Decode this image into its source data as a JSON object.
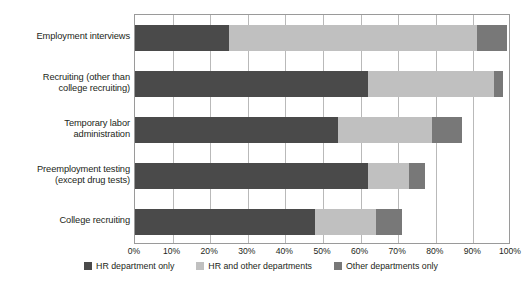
{
  "chart_data": {
    "type": "bar",
    "orientation": "horizontal",
    "stacked": true,
    "title": "",
    "xlabel": "",
    "ylabel": "",
    "xlim": [
      0,
      100
    ],
    "grid": true,
    "legend_position": "bottom",
    "categories": [
      "Employment interviews",
      "Recruiting (other than college recruiting)",
      "Temporary labor administration",
      "Preemployment testing (except drug tests)",
      "College recruiting"
    ],
    "category_lines": [
      [
        "Employment interviews"
      ],
      [
        "Recruiting (other than",
        "college recruiting)"
      ],
      [
        "Temporary labor",
        "administration"
      ],
      [
        "Preemployment testing",
        "(except drug tests)"
      ],
      [
        "College recruiting"
      ]
    ],
    "series": [
      {
        "name": "HR department only",
        "color": "#4a4a4a",
        "values": [
          25,
          62,
          54,
          62,
          48
        ]
      },
      {
        "name": "HR and other departments",
        "color": "#c0c0c0",
        "values": [
          66,
          33.5,
          25,
          11,
          16
        ]
      },
      {
        "name": "Other departments only",
        "color": "#787878",
        "values": [
          8,
          2.5,
          8,
          4,
          7
        ]
      }
    ],
    "tick_labels": [
      "0%",
      "10%",
      "20%",
      "30%",
      "40%",
      "50%",
      "60%",
      "70%",
      "80%",
      "90%",
      "100%"
    ],
    "tick_values": [
      0,
      10,
      20,
      30,
      40,
      50,
      60,
      70,
      80,
      90,
      100
    ]
  }
}
